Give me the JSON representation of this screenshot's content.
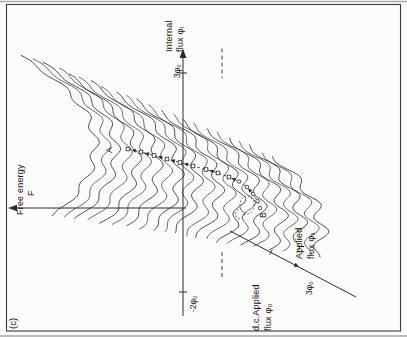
{
  "figure": {
    "panel_label": "(c)",
    "bg_color": "#fcfcfa",
    "ink_color": "#2a2a2a",
    "frame_color": "#3a3a3a",
    "scan_edge_color": "#a9a9a6"
  },
  "axes": {
    "free_energy": {
      "line1": "Free energy",
      "line2": "F"
    },
    "internal": {
      "line1": "Internal",
      "line2": "flux φᵢ",
      "tick_top": "3φ₀",
      "tick_neg": "-2φ₀"
    },
    "applied": {
      "line1": "Applied",
      "line2": "flux φₓ",
      "tick": "3φ₀"
    },
    "dc": {
      "line1": "d.c.Applied",
      "line2": "flux φ₀"
    }
  },
  "annotations": {
    "a": "A",
    "b": "B"
  },
  "chart_data": {
    "type": "line",
    "title": "",
    "xlabel": "Internal flux φᵢ",
    "ylabel": "Free energy F",
    "depth_axis_label": "Applied flux φₓ",
    "x_ticks": [
      "-2φ₀",
      "3φ₀"
    ],
    "depth_ticks": [
      "3φ₀"
    ],
    "reference_line_label": "d.c.Applied flux φ₀",
    "annotations": [
      "A",
      "B"
    ],
    "n_curves": 23
  },
  "render": {
    "n_curves": 23,
    "curve": {
      "vx0": 197,
      "vxStep": -4.1,
      "vy0": 96,
      "vyStep": 10.3,
      "hwR0": 88,
      "hwRStep": -0.5,
      "riseR0": 78,
      "riseRStep": -1.2,
      "hwL0": 74,
      "hwLStep": -2.2,
      "hwLMin": 26,
      "riseL0": 42,
      "riseLStep": -1.6,
      "riseLMin": 8,
      "expR": 1.9,
      "expL": 2.2,
      "amp0": 4.2,
      "ampStep": 0.11,
      "ampFloor": 0.45,
      "ampEnvSigma2": 4900,
      "period": 27.5,
      "step": 2.2
    },
    "trajectory": [
      [
        189,
        128
      ],
      [
        186,
        141
      ],
      [
        182.5,
        154
      ],
      [
        179,
        167
      ],
      [
        175.5,
        180
      ],
      [
        172,
        193
      ],
      [
        168.5,
        206
      ],
      [
        165,
        218
      ],
      [
        161,
        229
      ],
      [
        156.5,
        239
      ],
      [
        151,
        247
      ],
      [
        144,
        253
      ],
      [
        137,
        257.5
      ],
      [
        130,
        260
      ]
    ],
    "squares_until": 9,
    "arrow_segments": [
      0,
      1,
      2,
      3,
      4,
      6,
      8,
      10
    ],
    "basin_ellipse": [
      133,
      247,
      9,
      7
    ],
    "basin_circle": [
      124,
      240,
      4.5
    ]
  }
}
